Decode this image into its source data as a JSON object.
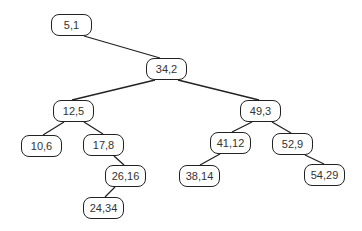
{
  "diagram": {
    "type": "binary-tree",
    "colors": {
      "stroke": "#222222",
      "text": "#333333",
      "background": "#ffffff"
    },
    "nodes": [
      {
        "id": "n5_1",
        "label": "5,1",
        "x": 51,
        "y": 14
      },
      {
        "id": "n34_2",
        "label": "34,2",
        "x": 146,
        "y": 58
      },
      {
        "id": "n12_5",
        "label": "12,5",
        "x": 53,
        "y": 100
      },
      {
        "id": "n49_3",
        "label": "49,3",
        "x": 240,
        "y": 100
      },
      {
        "id": "n10_6",
        "label": "10,6",
        "x": 21,
        "y": 135
      },
      {
        "id": "n17_8",
        "label": "17,8",
        "x": 83,
        "y": 134
      },
      {
        "id": "n41_12",
        "label": "41,12",
        "x": 210,
        "y": 132
      },
      {
        "id": "n52_9",
        "label": "52,9",
        "x": 272,
        "y": 133
      },
      {
        "id": "n26_16",
        "label": "26,16",
        "x": 105,
        "y": 165
      },
      {
        "id": "n38_14",
        "label": "38,14",
        "x": 179,
        "y": 165
      },
      {
        "id": "n54_29",
        "label": "54,29",
        "x": 304,
        "y": 164
      },
      {
        "id": "n24_34",
        "label": "24,34",
        "x": 83,
        "y": 197
      }
    ],
    "edges": [
      {
        "from": "5,1",
        "to": "34,2",
        "x1": 84,
        "y1": 36,
        "x2": 160,
        "y2": 58
      },
      {
        "from": "34,2",
        "to": "12,5",
        "x1": 155,
        "y1": 80,
        "x2": 72,
        "y2": 100
      },
      {
        "from": "34,2",
        "to": "49,3",
        "x1": 178,
        "y1": 80,
        "x2": 259,
        "y2": 100
      },
      {
        "from": "12,5",
        "to": "10,6",
        "x1": 64,
        "y1": 122,
        "x2": 43,
        "y2": 135
      },
      {
        "from": "12,5",
        "to": "17,8",
        "x1": 84,
        "y1": 122,
        "x2": 103,
        "y2": 134
      },
      {
        "from": "17,8",
        "to": "26,16",
        "x1": 114,
        "y1": 156,
        "x2": 124,
        "y2": 165
      },
      {
        "from": "26,16",
        "to": "24,34",
        "x1": 115,
        "y1": 187,
        "x2": 105,
        "y2": 197
      },
      {
        "from": "49,3",
        "to": "41,12",
        "x1": 252,
        "y1": 122,
        "x2": 232,
        "y2": 132
      },
      {
        "from": "49,3",
        "to": "52,9",
        "x1": 272,
        "y1": 122,
        "x2": 291,
        "y2": 133
      },
      {
        "from": "41,12",
        "to": "38,14",
        "x1": 220,
        "y1": 154,
        "x2": 200,
        "y2": 165
      },
      {
        "from": "52,9",
        "to": "54,29",
        "x1": 305,
        "y1": 155,
        "x2": 324,
        "y2": 164
      }
    ]
  }
}
